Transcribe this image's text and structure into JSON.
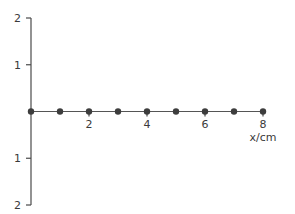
{
  "chart_data": {
    "type": "scatter",
    "title": "",
    "xlabel": "x/cm",
    "ylabel": "",
    "xlim": [
      0,
      8
    ],
    "ylim": [
      -2,
      2
    ],
    "grid": false,
    "legend": "none",
    "x_ticks": [
      {
        "value": 2,
        "label": "2"
      },
      {
        "value": 4,
        "label": "4"
      },
      {
        "value": 6,
        "label": "6"
      },
      {
        "value": 8,
        "label": "8"
      }
    ],
    "y_ticks": [
      {
        "value": 2,
        "label": "2"
      },
      {
        "value": 1,
        "label": "1"
      },
      {
        "value": -1,
        "label": "1"
      },
      {
        "value": -2,
        "label": "2"
      }
    ],
    "series": [
      {
        "name": "particles",
        "x": [
          0,
          1,
          2,
          3,
          4,
          5,
          6,
          7,
          8
        ],
        "y": [
          0,
          0,
          0,
          0,
          0,
          0,
          0,
          0,
          0
        ],
        "connected": true
      }
    ],
    "colors": {
      "points": "#3d3d3d",
      "axis": "#4a4a4a",
      "text": "#3a3a3a"
    }
  }
}
